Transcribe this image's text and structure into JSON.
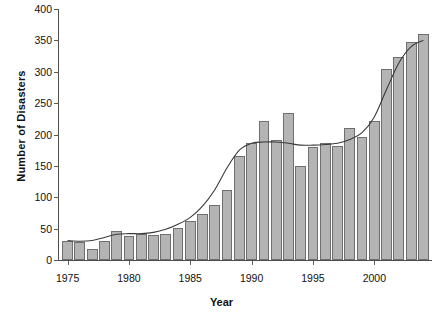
{
  "chart_data": {
    "type": "bar",
    "title": "",
    "xlabel": "Year",
    "ylabel": "Number of Disasters",
    "xlim": [
      1974.3,
      2004.7
    ],
    "ylim": [
      0,
      400
    ],
    "ytick_step": 50,
    "grid": false,
    "legend": null,
    "bar_color": "#b4b4b4",
    "bar_edge_color": "#6f6f6f",
    "trend_color": "#3a3a3a",
    "axis_color": "#4e4e4e",
    "categories": [
      1975,
      1976,
      1977,
      1978,
      1979,
      1980,
      1981,
      1982,
      1983,
      1984,
      1985,
      1986,
      1987,
      1988,
      1989,
      1990,
      1991,
      1992,
      1993,
      1994,
      1995,
      1996,
      1997,
      1998,
      1999,
      2000,
      2001,
      2002,
      2003,
      2004
    ],
    "values": [
      31,
      28,
      18,
      30,
      46,
      39,
      41,
      40,
      41,
      51,
      62,
      74,
      88,
      112,
      166,
      186,
      222,
      191,
      234,
      150,
      180,
      186,
      182,
      210,
      196,
      222,
      305,
      324,
      348,
      360
    ],
    "xticks": [
      1975,
      1980,
      1985,
      1990,
      1995,
      2000
    ],
    "yticks": [
      0,
      50,
      100,
      150,
      200,
      250,
      300,
      350,
      400
    ],
    "series": [
      {
        "name": "Number of Disasters",
        "values": [
          31,
          28,
          18,
          30,
          46,
          39,
          41,
          40,
          41,
          51,
          62,
          74,
          88,
          112,
          166,
          186,
          222,
          191,
          234,
          150,
          180,
          186,
          182,
          210,
          196,
          222,
          305,
          324,
          348,
          360
        ]
      },
      {
        "name": "smoothed-trend",
        "type": "line",
        "values": [
          31,
          30,
          31,
          36,
          41,
          42,
          42,
          44,
          49,
          57,
          68,
          86,
          112,
          147,
          175,
          186,
          188,
          188,
          186,
          183,
          183,
          184,
          186,
          192,
          203,
          228,
          272,
          314,
          340,
          350
        ]
      }
    ]
  },
  "axis": {
    "y_label": "Number of Disasters",
    "x_label": "Year",
    "y_ticks": [
      "0",
      "50",
      "100",
      "150",
      "200",
      "250",
      "300",
      "350",
      "400"
    ],
    "x_ticks": [
      "1975",
      "1980",
      "1985",
      "1990",
      "1995",
      "2000"
    ]
  }
}
